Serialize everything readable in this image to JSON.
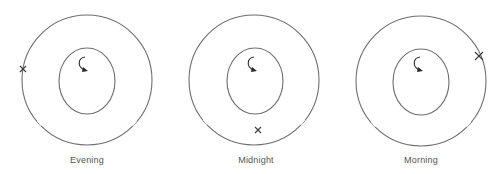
{
  "diagram": {
    "panels": [
      {
        "label": "Evening",
        "outer": {
          "cx": 87,
          "cy": 80,
          "r": 65
        },
        "inner": {
          "cx": 87,
          "cy": 81,
          "rx": 28,
          "ry": 33
        },
        "marker": {
          "x": 23,
          "y": 69
        }
      },
      {
        "label": "Midnight",
        "outer": {
          "cx": 254,
          "cy": 80,
          "r": 65
        },
        "inner": {
          "cx": 255,
          "cy": 81,
          "rx": 28,
          "ry": 33
        },
        "marker": {
          "x": 258,
          "y": 130
        }
      },
      {
        "label": "Morning",
        "outer": {
          "cx": 421,
          "cy": 81,
          "r": 65
        },
        "inner": {
          "cx": 421,
          "cy": 82,
          "rx": 28,
          "ry": 33
        },
        "marker": {
          "x": 479,
          "y": 56
        }
      }
    ],
    "colors": {
      "line": "#6e6e6e",
      "marker": "#3a3a3a",
      "label": "#555555"
    }
  }
}
